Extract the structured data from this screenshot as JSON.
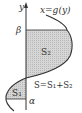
{
  "diagram": {
    "axis_label": "y",
    "curve_label": "x=g(y)",
    "upper_bound": "β",
    "lower_bound": "α",
    "region_upper": "S₂",
    "region_lower": "S₁",
    "formula": "S=S₁+S₂",
    "colors": {
      "line": "#333333",
      "fill": "#cfcfcf",
      "background": "#ffffff"
    }
  }
}
